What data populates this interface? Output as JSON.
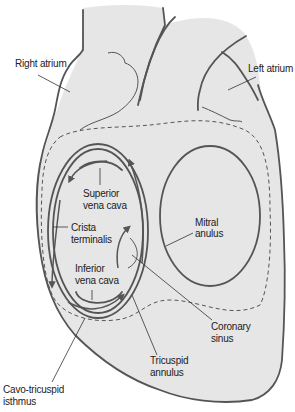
{
  "diagram": {
    "labels": {
      "right_atrium": "Right atrium",
      "left_atrium": "Left atrium",
      "superior_vena_cava_1": "Superior",
      "superior_vena_cava_2": "vena cava",
      "crista_terminalis_1": "Crista",
      "crista_terminalis_2": "terminalis",
      "inferior_vena_cava_1": "Inferior",
      "inferior_vena_cava_2": "vena cava",
      "mitral_anulus_1": "Mitral",
      "mitral_anulus_2": "anulus",
      "coronary_sinus_1": "Coronary",
      "coronary_sinus_2": "sinus",
      "tricuspid_annulus_1": "Tricuspid",
      "tricuspid_annulus_2": "annulus",
      "cavo_tricuspid_isthmus_1": "Cavo-tricuspid",
      "cavo_tricuspid_isthmus_2": "isthmus"
    },
    "colors": {
      "heart_fill": "#e6e6e6",
      "outline": "#555555",
      "background": "#ffffff"
    }
  }
}
